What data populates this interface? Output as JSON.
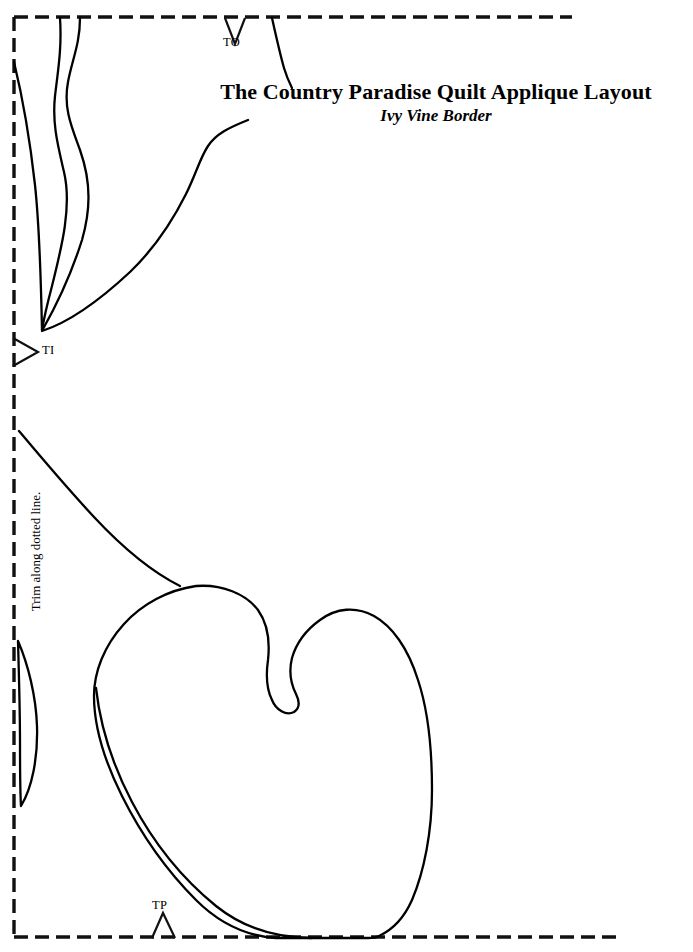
{
  "document": {
    "title_main": "The Country Paradise Quilt Applique Layout",
    "title_sub": "Ivy Vine Border",
    "trim_note": "Trim along dotted line.",
    "background_color": "#ffffff",
    "ink_color": "#000000"
  },
  "markers": [
    {
      "id": "TO",
      "label": "TO",
      "glyph": "down-chevron",
      "edge": "top",
      "x": 235,
      "y": 17
    },
    {
      "id": "TI",
      "label": "TI",
      "glyph": "right-chevron",
      "edge": "left",
      "x": 14,
      "y": 352
    },
    {
      "id": "TP",
      "label": "TP",
      "glyph": "up-triangle",
      "edge": "bottom",
      "x": 163,
      "y": 937
    }
  ],
  "trim_frame": {
    "style": "dashed",
    "stroke_width": 3,
    "dash": "14 7",
    "left_x": 14,
    "top_y": 17,
    "bottom_y": 937,
    "top_right_end_x": 572,
    "bottom_right_end_x": 617
  },
  "applique_pieces": [
    {
      "name": "narrow-upper-leaf",
      "description": "elongated ivy leaf converging at TI point"
    },
    {
      "name": "upper-stem",
      "description": "stem descending from top edge toward title"
    },
    {
      "name": "title-stem",
      "description": "short stem hanging from top dashed line"
    },
    {
      "name": "main-stem",
      "description": "long stem from left edge to heart leaf apex"
    },
    {
      "name": "heart-ivy-leaf",
      "description": "large two-lobed ivy leaf"
    },
    {
      "name": "leaf-vein",
      "description": "inner vein line of heart leaf"
    },
    {
      "name": "left-sliver-leaf",
      "description": "thin lens shaped leaf on left edge"
    }
  ]
}
